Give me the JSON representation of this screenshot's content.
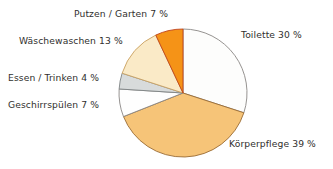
{
  "chart_data": {
    "type": "pie",
    "title": "",
    "subtitle": "",
    "xlabel": "",
    "ylabel": "",
    "legend_position": "none",
    "grid": false,
    "unit": "%",
    "start_angle_deg": 0,
    "direction": "clockwise",
    "center": {
      "x": 183,
      "y": 93
    },
    "radius": 64,
    "categories": [
      "Toilette",
      "Körperpflege",
      "Geschirrspülen",
      "Essen / Trinken",
      "Wäschewaschen",
      "Putzen / Garten"
    ],
    "values": [
      30,
      39,
      7,
      4,
      13,
      7
    ],
    "slices": [
      {
        "id": "toilette",
        "label": "Toilette 30 %",
        "name": "Toilette",
        "value": 30,
        "value_text": "30 %",
        "fill": "#fdfdfc",
        "stroke": "#8a8784",
        "start_deg": 0,
        "end_deg": 108
      },
      {
        "id": "koerperpflege",
        "label": "Körperpflege 39 %",
        "name": "Körperpflege",
        "value": 39,
        "value_text": "39 %",
        "fill": "#f6c478",
        "stroke": "#9a6b33",
        "start_deg": 108,
        "end_deg": 248.4
      },
      {
        "id": "geschirrspuelen",
        "label": "Geschirrspülen 7 %",
        "name": "Geschirrspülen",
        "value": 7,
        "value_text": "7 %",
        "fill": "#fefefe",
        "stroke": "#8a8784",
        "start_deg": 248.4,
        "end_deg": 273.6
      },
      {
        "id": "essen-trinken",
        "label": "Essen / Trinken 4 %",
        "name": "Essen / Trinken",
        "value": 4,
        "value_text": "4 %",
        "fill": "#d8dbdb",
        "stroke": "#7d8283",
        "start_deg": 273.6,
        "end_deg": 288
      },
      {
        "id": "waeschewaschen",
        "label": "Wäschewaschen 13 %",
        "name": "Wäschewaschen",
        "value": 13,
        "value_text": "13 %",
        "fill": "#faeac7",
        "stroke": "#c9a162",
        "start_deg": 288,
        "end_deg": 334.8
      },
      {
        "id": "putzen-garten",
        "label": "Putzen / Garten 7 %",
        "name": "Putzen / Garten",
        "value": 7,
        "value_text": "7 %",
        "fill": "#f59317",
        "stroke": "#c0421a",
        "start_deg": 334.8,
        "end_deg": 360
      }
    ],
    "colors": {
      "toilette": "#fdfdfc",
      "koerperpflege": "#f6c478",
      "geschirrspuelen": "#fefefe",
      "essen_trinken": "#d8dbdb",
      "waeschewaschen": "#faeac7",
      "putzen_garten": "#f59317",
      "label_text": "#312f2e",
      "background": "#ffffff"
    }
  },
  "labels": {
    "toilette": "Toilette 30 %",
    "koerperpflege": "Körperpflege 39 %",
    "geschirrspuelen": "Geschirrspülen 7 %",
    "essen_trinken": "Essen / Trinken 4 %",
    "waeschewaschen": "Wäschewaschen 13 %",
    "putzen_garten": "Putzen / Garten 7 %"
  }
}
